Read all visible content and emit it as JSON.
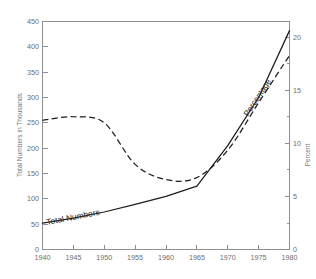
{
  "chart_data": {
    "type": "line",
    "title": "",
    "xlabel": "",
    "ylabel": "Total Numbers in Thousands",
    "y2label": "Percent",
    "grid": false,
    "legend": "inline-annotations",
    "xlim": [
      1940,
      1980
    ],
    "ylim": [
      0,
      450
    ],
    "y2lim": [
      0,
      21.47
    ],
    "xticks": [
      1940,
      1945,
      1950,
      1955,
      1960,
      1965,
      1970,
      1975,
      1980
    ],
    "xticklabels": [
      "1940",
      "1945",
      "1950",
      "1955",
      "1960",
      "1965",
      "1970",
      "1975",
      "1980"
    ],
    "yticks": [
      0,
      50,
      100,
      150,
      200,
      250,
      300,
      350,
      400,
      450
    ],
    "yticklabels": [
      "0",
      "50",
      "100",
      "150",
      "200",
      "250",
      "300",
      "350",
      "400",
      "450"
    ],
    "y2ticks": [
      0,
      5,
      10,
      15,
      20
    ],
    "y2ticklabels": [
      "0",
      "5",
      "10",
      "15",
      "20"
    ],
    "x": [
      1940,
      1945,
      1950,
      1955,
      1960,
      1965,
      1970,
      1975,
      1980
    ],
    "series": [
      {
        "name": "Total Numbers",
        "style": "solid",
        "axis": "left",
        "annotation": "Total Numbers",
        "values": [
          52,
          62,
          74,
          89,
          105,
          125,
          205,
          300,
          432
        ]
      },
      {
        "name": "Percentage",
        "style": "dashed",
        "axis": "right",
        "annotation": "Percentage",
        "values_left_scale": [
          255,
          262,
          250,
          168,
          138,
          142,
          196,
          290,
          383
        ],
        "values": [
          12.2,
          12.5,
          11.9,
          8.0,
          6.6,
          6.8,
          9.4,
          13.8,
          18.3
        ]
      }
    ]
  },
  "annotations": {
    "total_numbers": "Total Numbers",
    "percentage": "Percentage"
  },
  "axes": {
    "left_title": "Total Numbers in Thousands",
    "right_title": "Percent"
  }
}
